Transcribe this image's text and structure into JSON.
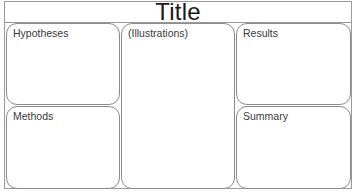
{
  "poster": {
    "title": "Title",
    "panels": {
      "hypotheses": "Hypotheses",
      "methods": "Methods",
      "illustrations": "(Illustrations)",
      "results": "Results",
      "summary": "Summary"
    }
  }
}
